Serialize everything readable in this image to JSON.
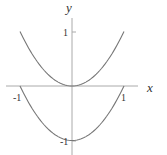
{
  "chart_data": {
    "type": "line",
    "title": "",
    "xlabel": "x",
    "ylabel": "y",
    "xlim": [
      -1.1,
      1.2
    ],
    "ylim": [
      -1.2,
      1.3
    ],
    "grid": false,
    "legend": null,
    "x_ticks": [
      {
        "value": -1,
        "label": "-1"
      },
      {
        "value": 1,
        "label": "1"
      }
    ],
    "y_ticks": [
      {
        "value": 1,
        "label": "1"
      },
      {
        "value": -1,
        "label": "-1"
      }
    ],
    "series": [
      {
        "name": "y = x^2",
        "x": [
          -1,
          -0.5,
          0,
          0.5,
          1
        ],
        "y": [
          1,
          0.25,
          0,
          0.25,
          1
        ]
      },
      {
        "name": "y = x^2 - 1",
        "x": [
          -1,
          -0.5,
          0,
          0.5,
          1
        ],
        "y": [
          0,
          -0.75,
          -1,
          -0.75,
          0
        ]
      }
    ],
    "colors": {
      "curve": "#666666",
      "axis": "#999999"
    }
  }
}
